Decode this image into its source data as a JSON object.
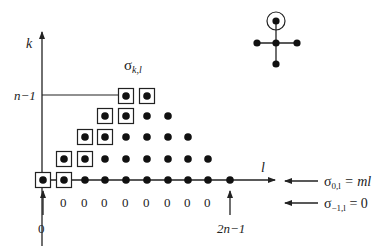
{
  "diagram": {
    "axes": {
      "y_label": "k",
      "x_label": "l",
      "row_label": "n−1",
      "origin_label": "0",
      "end_label": "2n−1"
    },
    "grid_title": {
      "sigma": "σ",
      "sub": "k,l"
    },
    "bottom_zero_labels": [
      "0",
      "0",
      "0",
      "0",
      "0",
      "0",
      "0",
      "0"
    ],
    "annotations": [
      {
        "sigma": "σ",
        "sub": "0,l",
        "rhs": " = ml"
      },
      {
        "sigma": "σ",
        "sub": "−1,l",
        "rhs": " = 0"
      }
    ],
    "rows": [
      {
        "k": 0,
        "l_from": 0,
        "l_to": 9,
        "boxed": [
          0,
          1
        ]
      },
      {
        "k": 1,
        "l_from": 1,
        "l_to": 8,
        "boxed": [
          1,
          2
        ]
      },
      {
        "k": 2,
        "l_from": 2,
        "l_to": 7,
        "boxed": [
          2,
          3
        ]
      },
      {
        "k": 3,
        "l_from": 3,
        "l_to": 6,
        "boxed": [
          3,
          4
        ]
      },
      {
        "k": 4,
        "l_from": 4,
        "l_to": 5,
        "boxed": [
          4,
          5
        ]
      }
    ],
    "graph_icon": {
      "nodes": [
        "top-circled",
        "center",
        "left",
        "right",
        "bottom"
      ]
    },
    "colors": {
      "ink": "#222222",
      "background": "#ffffff"
    }
  }
}
